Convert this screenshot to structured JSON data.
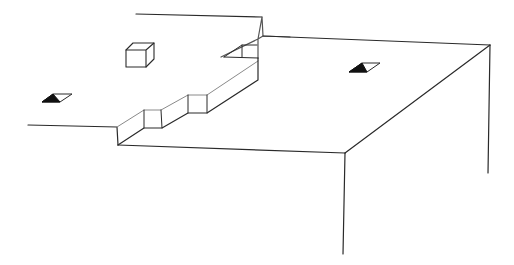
{
  "diagram": {
    "type": "isometric-line-drawing",
    "colors": {
      "background": "#ffffff",
      "stroke": "#2a2a2a",
      "light_stroke": "#8a8a8a",
      "fill_dark": "#111111"
    },
    "elements": [
      {
        "name": "upper-platform-back-edge"
      },
      {
        "name": "upper-platform-left-edge"
      },
      {
        "name": "stepped-riser"
      },
      {
        "name": "lower-platform-front-edge"
      },
      {
        "name": "lower-platform-right-edge"
      },
      {
        "name": "vertical-corner-edge-front"
      },
      {
        "name": "vertical-corner-edge-right"
      },
      {
        "name": "small-cube"
      },
      {
        "name": "opening-left"
      },
      {
        "name": "opening-right"
      },
      {
        "name": "notch-top"
      }
    ]
  }
}
